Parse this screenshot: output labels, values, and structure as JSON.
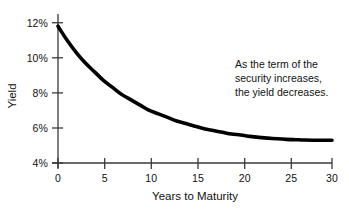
{
  "chart_data": {
    "type": "line",
    "title": "",
    "xlabel": "Years to Maturity",
    "ylabel": "Yield",
    "xlim": [
      0,
      30
    ],
    "ylim": [
      4,
      12
    ],
    "grid": false,
    "legend": null,
    "x_ticks": [
      "0",
      "5",
      "10",
      "15",
      "20",
      "25",
      "30"
    ],
    "x_tick_values": [
      0,
      5,
      10,
      15,
      20,
      25,
      30
    ],
    "y_ticks": [
      "4%",
      "6%",
      "8%",
      "10%",
      "12%"
    ],
    "y_tick_values": [
      4,
      6,
      8,
      10,
      12
    ],
    "series": [
      {
        "name": "Yield curve",
        "color": "#000000",
        "x": [
          0,
          1,
          2,
          3,
          4,
          5,
          6,
          7,
          8,
          9,
          10,
          11,
          12,
          13,
          14,
          15,
          16,
          17,
          18,
          19,
          20,
          21,
          22,
          23,
          24,
          25,
          26,
          27,
          28,
          29,
          30
        ],
        "values": [
          11.8,
          11.0,
          10.3,
          9.7,
          9.2,
          8.7,
          8.3,
          7.9,
          7.6,
          7.3,
          7.0,
          6.8,
          6.6,
          6.4,
          6.25,
          6.1,
          5.95,
          5.85,
          5.75,
          5.65,
          5.6,
          5.52,
          5.46,
          5.42,
          5.38,
          5.35,
          5.33,
          5.31,
          5.3,
          5.3,
          5.3
        ]
      }
    ],
    "annotations": [
      {
        "lines": [
          "As the term of the",
          "security increases,",
          "the yield decreases."
        ]
      }
    ],
    "colors": {
      "curve": "#000000",
      "axis": "#3a3a3a",
      "text": "#111111",
      "background": "#ffffff"
    }
  }
}
